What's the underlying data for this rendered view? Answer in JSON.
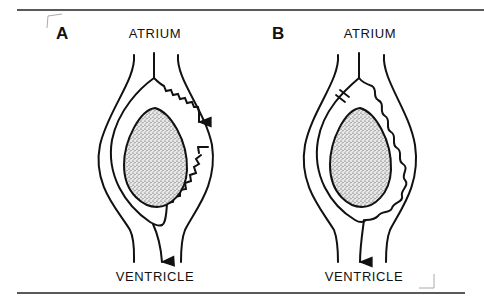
{
  "figure": {
    "stroke_color": "#111111",
    "stipple_color": "#333333",
    "panels": [
      {
        "id": "A",
        "letter": "A",
        "top_label": "ATRIUM",
        "bottom_label": "VENTRICLE",
        "description": "Impulse travels down right pathway (wavy), blocked partway; impulse continues down to ventricle"
      },
      {
        "id": "B",
        "letter": "B",
        "top_label": "ATRIUM",
        "bottom_label": "VENTRICLE",
        "description": "Left pathway blocked near top; impulse travels down right wavy pathway to ventricle"
      }
    ]
  }
}
